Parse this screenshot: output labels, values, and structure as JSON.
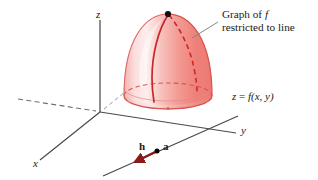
{
  "figure": {
    "background_color": "#ffffff",
    "width": 318,
    "height": 180
  },
  "callout": {
    "line1_prefix": "Graph of ",
    "line1_italic": "f",
    "line2": "restricted to line"
  },
  "equation": {
    "lhs": "z",
    "eq": " = ",
    "fn": "f",
    "args": "(x, y)"
  },
  "axes": {
    "z_label": "z",
    "y_label": "y",
    "x_label": "x",
    "axis_color": "#4a4a4a",
    "dashed_axis_color": "#6e6e6e"
  },
  "vectors": {
    "h_label": "h",
    "a_label": "a",
    "segment_color": "#8b1a1a",
    "point_color": "#000000"
  },
  "surface": {
    "fill_light": "#fbdede",
    "fill_mid": "#f5a9a4",
    "fill_dark": "#ef8078",
    "outline_color": "#d9534f",
    "curve_color": "#c9262c",
    "dashed_curve_color": "#c9262c",
    "apex_dot_color": "#111111"
  },
  "leader": {
    "color": "#808080"
  }
}
